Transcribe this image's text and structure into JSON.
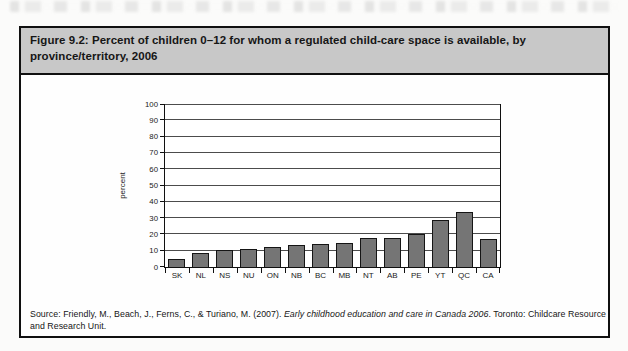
{
  "figure": {
    "title": "Figure 9.2: Percent of children 0–12 for whom a regulated child-care space is available, by province/territory, 2006"
  },
  "source": {
    "prefix": "Source: Friendly, M., Beach, J., Ferns, C., & Turiano, M. (2007). ",
    "title_italic": "Early childhood education and care in Canada 2006",
    "suffix": ". Toronto: Childcare Resource and Research Unit."
  },
  "chart_data": {
    "type": "bar",
    "title": "Percent of children 0–12 for whom a regulated child-care space is available, by province/territory, 2006",
    "categories": [
      "SK",
      "NL",
      "NS",
      "NU",
      "ON",
      "NB",
      "BC",
      "MB",
      "NT",
      "AB",
      "PE",
      "YT",
      "QC",
      "CA"
    ],
    "values": [
      5,
      8.5,
      10.5,
      11,
      12,
      13.5,
      14,
      14.5,
      18,
      17.5,
      20,
      29,
      34,
      17
    ],
    "xlabel": "",
    "ylabel": "percent",
    "ylim": [
      0,
      100
    ],
    "yticks": [
      0,
      10,
      20,
      30,
      40,
      50,
      60,
      70,
      80,
      90,
      100
    ],
    "grid": true,
    "legend": "none",
    "bar_color": "#757575",
    "bar_border_color": "#151515"
  },
  "colors": {
    "header_bg": "#c8c8c8",
    "box_border": "#101010",
    "gridline": "#4c4c4c"
  }
}
